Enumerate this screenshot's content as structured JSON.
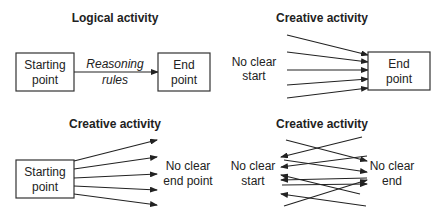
{
  "panels": [
    {
      "title": "Logical activity",
      "start_box": [
        "Starting",
        "point"
      ],
      "end_box": [
        "End",
        "point"
      ],
      "arrow_label": [
        "Reasoning",
        "rules"
      ]
    },
    {
      "title": "Creative activity",
      "start_text": [
        "No clear",
        "start"
      ],
      "end_box": [
        "End",
        "point"
      ]
    },
    {
      "title": "Creative activity",
      "start_box": [
        "Starting",
        "point"
      ],
      "end_text": [
        "No clear",
        "end point"
      ]
    },
    {
      "title": "Creative activity",
      "start_text": [
        "No clear",
        "start"
      ],
      "end_text": [
        "No clear",
        "end"
      ]
    }
  ]
}
